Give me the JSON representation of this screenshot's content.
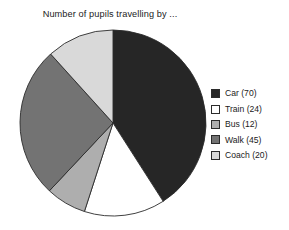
{
  "chart_data": {
    "type": "pie",
    "title": "Number of pupils travelling by ...",
    "xlabel": "",
    "ylabel": "",
    "legend_position": "right",
    "grid": false,
    "total": 171,
    "start_angle_deg": 0,
    "direction": "clockwise",
    "categories": [
      "Car",
      "Train",
      "Bus",
      "Walk",
      "Coach"
    ],
    "values": [
      70,
      24,
      12,
      45,
      20
    ],
    "slices": [
      {
        "label": "Car",
        "value": 70,
        "legend_text": "Car (70)",
        "color": "#262626",
        "angle_deg": 147.4
      },
      {
        "label": "Train",
        "value": 24,
        "legend_text": "Train (24)",
        "color": "#ffffff",
        "angle_deg": 50.5
      },
      {
        "label": "Bus",
        "value": 12,
        "legend_text": "Bus (12)",
        "color": "#aeaeae",
        "angle_deg": 25.3
      },
      {
        "label": "Walk",
        "value": 45,
        "legend_text": "Walk (45)",
        "color": "#737373",
        "angle_deg": 94.7
      },
      {
        "label": "Coach",
        "value": 20,
        "legend_text": "Coach (20)",
        "color": "#d9d9d9",
        "angle_deg": 42.1
      }
    ],
    "stroke_color": "#2b2b2b"
  },
  "legend": {
    "items": [
      {
        "swatch_name": "legend-swatch-car",
        "text": "Car (70)"
      },
      {
        "swatch_name": "legend-swatch-train",
        "text": "Train (24)"
      },
      {
        "swatch_name": "legend-swatch-bus",
        "text": "Bus (12)"
      },
      {
        "swatch_name": "legend-swatch-walk",
        "text": "Walk (45)"
      },
      {
        "swatch_name": "legend-swatch-coach",
        "text": "Coach (20)"
      }
    ]
  }
}
